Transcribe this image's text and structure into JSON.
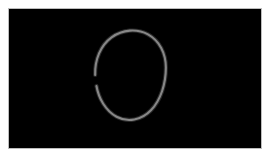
{
  "app": {
    "title": "Drawing Canvas",
    "surface_label": "drawing-surface"
  },
  "canvas": {
    "width": 272,
    "height": 160,
    "background_color": "#ffffff",
    "surface_color": "#000000",
    "surface_border_color": "#bdbdbd",
    "surface_x": 8,
    "surface_y": 8,
    "surface_width": 254,
    "surface_height": 141
  },
  "strokes": [
    {
      "id": "stroke-open-oval",
      "tool": "pencil",
      "shape": "open-ellipse",
      "color": "#8c8c8c",
      "glow_color": "#4a4a4a",
      "width": 2.1,
      "opacity": 0.95,
      "closed": false,
      "gap_side": "left",
      "bounds": {
        "x_min": 95,
        "y_min": 31,
        "x_max": 166,
        "y_max": 121
      },
      "path": "M 95.5 75.5 C 95.0 60.0 101.0 45.5 112.0 37.5 C 123.0 29.5 137.5 28.5 148.5 34.5 C 160.0 40.8 166.5 53.5 166.5 68.0 C 166.5 84.0 161.5 100.5 151.5 111.0 C 142.0 121.0 128.0 123.5 117.0 117.5 C 106.0 111.5 99.0 99.0 96.8 86.5",
      "path_gap_start": {
        "x": 95.5,
        "y": 75.5
      },
      "path_gap_end": {
        "x": 96.8,
        "y": 86.5
      }
    }
  ]
}
